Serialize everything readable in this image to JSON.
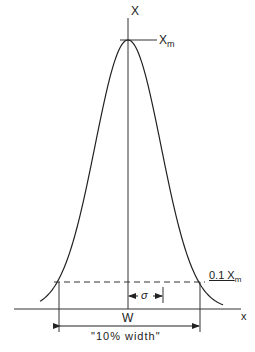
{
  "figure": {
    "y_axis_label": "X",
    "x_axis_label": "x",
    "peak_label": "X",
    "peak_label_sub": "m",
    "threshold_label": "0.1 X",
    "threshold_label_sub": "m",
    "sigma_label": "σ",
    "width_label": "W",
    "width_caption": "\"10% width\""
  },
  "colors": {
    "ink": "#222222",
    "background": "#ffffff"
  }
}
